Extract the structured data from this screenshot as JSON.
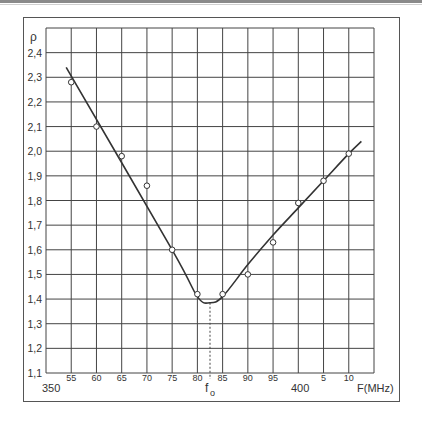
{
  "chart_data": {
    "type": "line",
    "title": "",
    "xlabel": "F(MHz)",
    "ylabel": "ρ",
    "xlim": [
      350,
      415
    ],
    "ylim": [
      1.1,
      2.5
    ],
    "grid": true,
    "x_ticks": [
      {
        "value": 355,
        "label": "55"
      },
      {
        "value": 360,
        "label": "60"
      },
      {
        "value": 365,
        "label": "65"
      },
      {
        "value": 370,
        "label": "70"
      },
      {
        "value": 375,
        "label": "75"
      },
      {
        "value": 380,
        "label": "80"
      },
      {
        "value": 385,
        "label": "85"
      },
      {
        "value": 390,
        "label": "90"
      },
      {
        "value": 395,
        "label": "95"
      },
      {
        "value": 405,
        "label": "5"
      },
      {
        "value": 410,
        "label": "10"
      }
    ],
    "x_major_labels": [
      {
        "value": 350,
        "label": "350"
      },
      {
        "value": 400,
        "label": "400"
      }
    ],
    "y_ticks": [
      {
        "value": 2.4,
        "label": "2,4"
      },
      {
        "value": 2.3,
        "label": "2,3"
      },
      {
        "value": 2.2,
        "label": "2,2"
      },
      {
        "value": 2.1,
        "label": "2,1"
      },
      {
        "value": 2.0,
        "label": "2,0"
      },
      {
        "value": 1.9,
        "label": "1,9"
      },
      {
        "value": 1.8,
        "label": "1,8"
      },
      {
        "value": 1.7,
        "label": "1,7"
      },
      {
        "value": 1.6,
        "label": "1,6"
      },
      {
        "value": 1.5,
        "label": "1,5"
      },
      {
        "value": 1.4,
        "label": "1,4"
      },
      {
        "value": 1.3,
        "label": "1,3"
      },
      {
        "value": 1.2,
        "label": "1,2"
      },
      {
        "value": 1.1,
        "label": "1,1"
      }
    ],
    "series": [
      {
        "name": "measured",
        "style": "open-circle markers",
        "x": [
          355,
          360,
          365,
          370,
          375,
          380,
          385,
          390,
          395,
          400,
          405,
          410
        ],
        "y": [
          2.28,
          2.1,
          1.98,
          1.86,
          1.6,
          1.42,
          1.42,
          1.5,
          1.63,
          1.79,
          1.88,
          1.99
        ]
      },
      {
        "name": "fitted curve",
        "style": "solid line",
        "x": [
          354,
          375,
          380,
          382.5,
          385,
          390,
          395,
          400,
          405,
          410,
          412.5
        ],
        "y": [
          2.34,
          1.6,
          1.41,
          1.385,
          1.41,
          1.54,
          1.66,
          1.77,
          1.88,
          1.99,
          2.04
        ]
      }
    ],
    "annotations": [
      {
        "type": "vline-dashed",
        "x": 382.5,
        "from_y": 1.385,
        "to_y": 1.1,
        "label": "f",
        "subscript": "o"
      }
    ]
  },
  "labels": {
    "y_axis_symbol": "ρ",
    "x_axis_unit": "F(MHz)",
    "f0_main": "f",
    "f0_sub": "o",
    "x350": "350",
    "x400": "400"
  }
}
